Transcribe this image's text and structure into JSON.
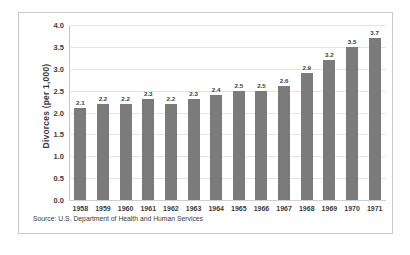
{
  "chart_data": {
    "type": "bar",
    "title": "",
    "xlabel": "",
    "ylabel": "Divorces (per 1,000)",
    "categories": [
      "1958",
      "1959",
      "1960",
      "1961",
      "1962",
      "1963",
      "1964",
      "1965",
      "1966",
      "1967",
      "1968",
      "1969",
      "1970",
      "1971"
    ],
    "values": [
      2.1,
      2.2,
      2.2,
      2.3,
      2.2,
      2.3,
      2.4,
      2.5,
      2.5,
      2.6,
      2.9,
      3.2,
      3.5,
      3.7
    ],
    "value_labels": [
      "2.1",
      "2.2",
      "2.2",
      "2.3",
      "2.2",
      "2.3",
      "2.4",
      "2.5",
      "2.5",
      "2.6",
      "2.9",
      "3.2",
      "3.5",
      "3.7"
    ],
    "ylim": [
      0.0,
      4.0
    ],
    "ytick_values": [
      0.0,
      0.5,
      1.0,
      1.5,
      2.0,
      2.5,
      3.0,
      3.5,
      4.0
    ],
    "ytick_labels": [
      "0.0",
      "0.5",
      "1.0",
      "1.5",
      "2.0",
      "2.5",
      "3.0",
      "3.5",
      "4.0"
    ],
    "grid": true,
    "legend": false,
    "bar_color": "#7b7b7b",
    "grid_color": "#e4e4e4",
    "text_color": "#3b3b3b"
  },
  "source_note": "Source: U.S. Department of Health and Human Services"
}
